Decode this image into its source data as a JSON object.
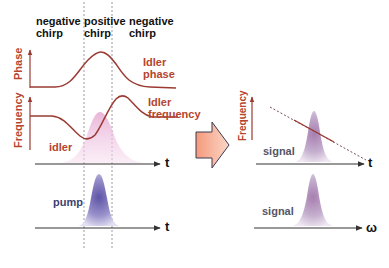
{
  "header": {
    "regions": [
      {
        "line1": "negative",
        "line2": "chirp"
      },
      {
        "line1": "positive",
        "line2": "chirp"
      },
      {
        "line1": "negative",
        "line2": "chirp"
      }
    ]
  },
  "left_panel": {
    "phase_axis_label": "Phase",
    "frequency_axis_label": "Frequency",
    "idler_phase_label": {
      "line1": "Idler",
      "line2": "phase"
    },
    "idler_frequency_label": {
      "line1": "Idler",
      "line2": "frequency"
    },
    "idler_pulse_label": "idler",
    "pump_pulse_label": "pump",
    "time_axis_label_1": "t",
    "time_axis_label_2": "t"
  },
  "right_panel": {
    "frequency_axis_label": "Frequency",
    "signal_time_label": "signal",
    "signal_spectrum_label": "signal",
    "time_axis_label": "t",
    "frequency_axis_omega_label": "ω"
  },
  "colors": {
    "curve": "#9a3b33",
    "label_red": "#b5452f",
    "idler_fill": "#e9b4d6",
    "pump_fill": "#7f74b8",
    "signal_fill": "#b79ac0",
    "arrow_fill": "#f4a98a",
    "arrow_stroke": "#3a3a55",
    "axis": "#333333",
    "dotted": "#9a9aa8"
  }
}
